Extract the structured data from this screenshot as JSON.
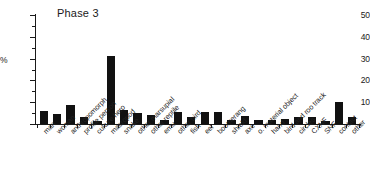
{
  "chart_data": {
    "type": "bar",
    "title": "Phase 3",
    "xlabel": "",
    "ylabel": "%",
    "ylim": [
      0,
      50
    ],
    "yticks": [
      0,
      10,
      20,
      30,
      40,
      50
    ],
    "ytick_labels": [
      "",
      "10",
      "20",
      "30",
      "40",
      "50"
    ],
    "minor_ticks": true,
    "grid": false,
    "legend": false,
    "bar_color": "#111111",
    "categories": [
      "man",
      "woman",
      "anthropomorph",
      "profile person",
      "culture hero",
      "macropod",
      "snake",
      "other marsupial",
      "other reptile",
      "emu",
      "other bird",
      "fish",
      "eel",
      "boomerang",
      "shield",
      "axe",
      "o. material object",
      "hand",
      "bird and roo track",
      "circles",
      "CXNF",
      "SNF",
      "contact",
      "other"
    ],
    "values": [
      6.0,
      4.5,
      8.5,
      3.0,
      1.5,
      31.0,
      6.5,
      5.0,
      4.0,
      2.0,
      5.5,
      3.0,
      5.5,
      5.5,
      2.0,
      3.5,
      2.0,
      2.0,
      2.5,
      3.0,
      3.0,
      1.5,
      10.0,
      3.0
    ]
  }
}
